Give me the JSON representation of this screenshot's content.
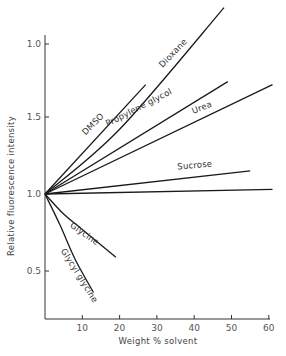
{
  "chart_data": {
    "type": "line",
    "title": "",
    "xlabel": "Weight % solvent",
    "ylabel": "Relative fluorescence intensity",
    "xlim": [
      0,
      62
    ],
    "ylim": [
      0.18,
      2.25
    ],
    "grid": false,
    "legend": "inline labels on curves",
    "x_ticks": [
      10,
      20,
      30,
      40,
      50,
      60
    ],
    "x_tick_labels": [
      "10",
      "20",
      "30",
      "40",
      "50",
      "60"
    ],
    "y_ticks": [
      0.5,
      1.0,
      1.5,
      2.0
    ],
    "y_tick_labels": [
      "0.5",
      "1.0",
      "1.5",
      "1.0"
    ],
    "series": [
      {
        "name": "DMSO",
        "label": "DMSO",
        "x": [
          0,
          27
        ],
        "y": [
          1.0,
          1.71
        ]
      },
      {
        "name": "Dioxane",
        "label": "Dioxane",
        "x": [
          0,
          20,
          48
        ],
        "y": [
          1.0,
          1.42,
          2.21
        ]
      },
      {
        "name": "Propylene glycol",
        "label": "Propylene glycol",
        "x": [
          0,
          49
        ],
        "y": [
          1.0,
          1.73
        ]
      },
      {
        "name": "Urea",
        "label": "Urea",
        "x": [
          0,
          61
        ],
        "y": [
          1.0,
          1.71
        ]
      },
      {
        "name": "Sucrose",
        "label": "Sucrose",
        "x": [
          0,
          55
        ],
        "y": [
          1.0,
          1.15
        ]
      },
      {
        "name": "Unlabeled",
        "label": "",
        "x": [
          0,
          61
        ],
        "y": [
          1.0,
          1.03
        ]
      },
      {
        "name": "Glycine",
        "label": "Glycine",
        "x": [
          0,
          5,
          10,
          19
        ],
        "y": [
          1.0,
          0.87,
          0.77,
          0.59
        ]
      },
      {
        "name": "Glycyl glycine",
        "label": "Glycyl glycine",
        "x": [
          0,
          4,
          8,
          13
        ],
        "y": [
          1.0,
          0.8,
          0.58,
          0.36
        ]
      }
    ]
  },
  "axes": {
    "x_title": "Weight % solvent",
    "y_title": "Relative fluorescence intensity"
  }
}
